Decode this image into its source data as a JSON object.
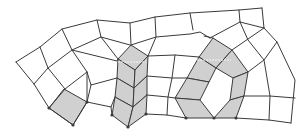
{
  "diagram": {
    "type": "quad-mesh",
    "colors": {
      "background": "#ffffff",
      "edge": "#3a3a3a",
      "shaded_cell": "#d0d0d0",
      "node": "#3a3a3a",
      "highlight": "#f4f4f4"
    },
    "shaded_cells": [
      {
        "id": "left-cell",
        "points": "64,89 87,102 73,125 49,108"
      },
      {
        "id": "column-top",
        "points": "118,59 131,45 148,56 135,70"
      },
      {
        "id": "column-2",
        "points": "118,59 135,70 134,88 117,78"
      },
      {
        "id": "column-3",
        "points": "117,78 134,88 133,107 115,97"
      },
      {
        "id": "column-4",
        "points": "115,97 133,107 128,127 112,115"
      },
      {
        "id": "column-right-top",
        "points": "135,70 148,56 147,76 134,88"
      },
      {
        "id": "column-right-2",
        "points": "134,88 147,76 147,95 133,107"
      },
      {
        "id": "column-right-3",
        "points": "133,107 147,95 146,114 128,127"
      },
      {
        "id": "ring-top",
        "points": "213,38 232,50 216,68 199,57"
      },
      {
        "id": "ring-top-right",
        "points": "232,50 248,72 233,78 216,68"
      },
      {
        "id": "ring-right",
        "points": "248,72 244,96 230,100 233,78"
      },
      {
        "id": "ring-bottom-right",
        "points": "244,96 236,118 214,118 230,100"
      },
      {
        "id": "ring-left-top",
        "points": "199,57 216,68 209,82 187,78"
      },
      {
        "id": "ring-left",
        "points": "187,78 209,82 200,100 175,98"
      },
      {
        "id": "ring-bottom-left",
        "points": "175,98 200,100 214,118 186,118"
      }
    ],
    "edges": [
      "16,62 40,47 62,29 97,20 130,23 155,17 190,13 239,10 262,8",
      "16,62 34,84 49,108 73,125",
      "40,47 48,68 65,89",
      "62,29 72,50 87,72 87,102",
      "34,84 48,68 72,50 101,37 130,45",
      "49,108 65,89 87,72",
      "97,20 101,37",
      "130,23 131,45",
      "101,37 118,59",
      "72,50 117,61 118,59",
      "87,72 91,85 117,78",
      "87,102 111,107 115,97",
      "91,85 87,102",
      "111,107 112,115",
      "73,125 87,102",
      "155,17 156,37 148,56",
      "131,45 156,37 190,34 200,32 210,38",
      "190,13 193,30",
      "239,10 240,22 264,28 262,8",
      "148,56 175,55 199,57",
      "147,76 172,78 187,78",
      "147,95 168,97 175,98",
      "146,114 167,115 186,118",
      "175,55 172,78 168,97 167,115",
      "210,38 240,22",
      "232,50 264,28",
      "264,28 277,42 295,80 291,123",
      "240,22 248,40 264,60 270,96 269,120",
      "248,72 264,60 277,42",
      "244,96 270,96 295,98",
      "236,118 269,120 291,123",
      "213,38 204,36"
    ],
    "nodes": [
      "49,108",
      "73,125",
      "87,102",
      "112,115",
      "128,127",
      "146,114",
      "186,118",
      "214,118",
      "236,118"
    ],
    "highlight_segments": [
      "118,62 146,62",
      "197,60 231,60"
    ]
  }
}
